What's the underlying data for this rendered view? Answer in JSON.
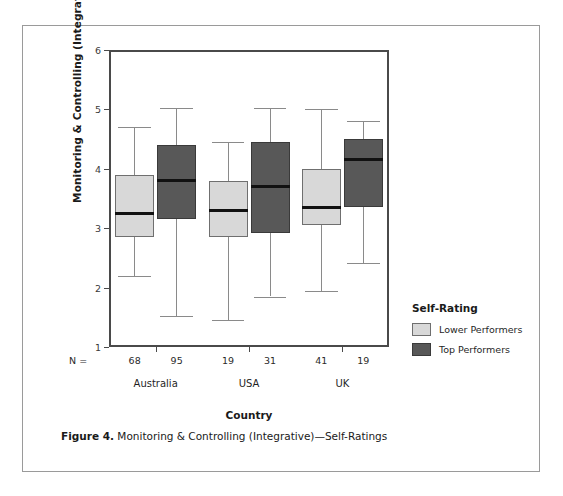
{
  "caption": {
    "prefix": "Figure 4.",
    "text": " Monitoring & Controlling (Integrative)—Self-Ratings"
  },
  "legend": {
    "title": "Self-Rating",
    "items": [
      {
        "label": "Lower Performers",
        "color": "#d8d8d8",
        "key": "lower"
      },
      {
        "label": "Top Performers",
        "color": "#585858",
        "key": "top"
      }
    ]
  },
  "axes": {
    "y_label": "Monitoring & Controlling (Integrative)",
    "x_label": "Country",
    "y_ticks": [
      "6",
      "5",
      "4",
      "3",
      "2",
      "1"
    ],
    "n_prefix": "N ="
  },
  "chart_data": {
    "type": "box",
    "title": "Monitoring & Controlling (Integrative)—Self-Ratings",
    "xlabel": "Country",
    "ylabel": "Monitoring & Controlling (Integrative)",
    "ylim": [
      1,
      6
    ],
    "yticks": [
      1,
      2,
      3,
      4,
      5,
      6
    ],
    "grid": false,
    "legend_position": "right",
    "categories": [
      "Australia",
      "USA",
      "UK"
    ],
    "group_counts_label": "N =",
    "series": [
      {
        "name": "Lower Performers",
        "color": "#d8d8d8",
        "boxes": [
          {
            "category": "Australia",
            "n": 68,
            "whisker_low": 2.2,
            "q1": 2.85,
            "median": 3.25,
            "q3": 3.9,
            "whisker_high": 4.7
          },
          {
            "category": "USA",
            "n": 19,
            "whisker_low": 1.45,
            "q1": 2.85,
            "median": 3.3,
            "q3": 3.8,
            "whisker_high": 4.45
          },
          {
            "category": "UK",
            "n": 41,
            "whisker_low": 1.95,
            "q1": 3.05,
            "median": 3.35,
            "q3": 4.0,
            "whisker_high": 5.0
          }
        ]
      },
      {
        "name": "Top Performers",
        "color": "#585858",
        "boxes": [
          {
            "category": "Australia",
            "n": 95,
            "whisker_low": 1.52,
            "q1": 3.15,
            "median": 3.8,
            "q3": 4.4,
            "whisker_high": 5.02
          },
          {
            "category": "USA",
            "n": 31,
            "whisker_low": 1.85,
            "q1": 2.92,
            "median": 3.7,
            "q3": 4.45,
            "whisker_high": 5.02
          },
          {
            "category": "UK",
            "n": 19,
            "whisker_low": 2.42,
            "q1": 3.35,
            "median": 4.15,
            "q3": 4.5,
            "whisker_high": 4.8
          }
        ]
      }
    ]
  }
}
